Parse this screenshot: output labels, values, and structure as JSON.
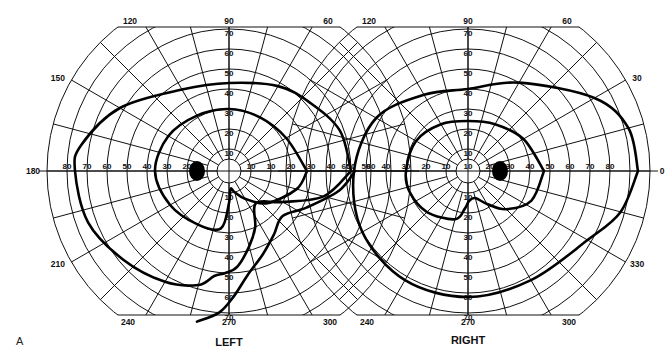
{
  "panel_label": "A",
  "chart_data": {
    "type": "polar",
    "units": "degrees of eccentricity",
    "ring_step": 10,
    "radial_range": [
      0,
      90
    ],
    "radial_tick_labels": [
      "10",
      "20",
      "30",
      "40",
      "50",
      "60",
      "70",
      "80"
    ],
    "meridian_step": 15,
    "angle_labels": [
      "0",
      "30",
      "60",
      "90",
      "120",
      "150",
      "180",
      "210",
      "240",
      "270",
      "300",
      "330"
    ],
    "charts": [
      {
        "name": "LEFT",
        "visible_angle_labels": [
          "90",
          "120",
          "60",
          "150",
          "180",
          "210",
          "240",
          "270",
          "300"
        ],
        "horizontal_tick_labels": [
          "80",
          "70",
          "60",
          "50",
          "40",
          "30",
          "20",
          "10",
          "10",
          "20",
          "30",
          "40",
          "50",
          "60"
        ],
        "vertical_tick_labels": [
          "70",
          "60",
          "50",
          "40",
          "30",
          "20",
          "10",
          "10",
          "20",
          "30",
          "40",
          "50",
          "60",
          "70"
        ],
        "blind_spot": {
          "angle": 180,
          "eccentricity": 15
        },
        "isopters": [
          {
            "name": "outer",
            "points": [
              [
                0,
                60
              ],
              [
                20,
                58
              ],
              [
                40,
                52
              ],
              [
                60,
                48
              ],
              [
                90,
                43
              ],
              [
                120,
                46
              ],
              [
                150,
                62
              ],
              [
                170,
                74
              ],
              [
                180,
                76
              ],
              [
                200,
                74
              ],
              [
                220,
                68
              ],
              [
                240,
                63
              ],
              [
                255,
                58
              ],
              [
                262,
                52
              ],
              [
                268,
                50
              ],
              [
                275,
                47
              ],
              [
                285,
                38
              ],
              [
                295,
                30
              ],
              [
                310,
                20
              ],
              [
                330,
                30
              ],
              [
                345,
                48
              ],
              [
                360,
                60
              ]
            ]
          },
          {
            "name": "inner",
            "points": [
              [
                0,
                38
              ],
              [
                30,
                32
              ],
              [
                60,
                30
              ],
              [
                90,
                30
              ],
              [
                120,
                31
              ],
              [
                150,
                34
              ],
              [
                180,
                36
              ],
              [
                210,
                33
              ],
              [
                240,
                30
              ],
              [
                262,
                28
              ],
              [
                270,
                15
              ],
              [
                275,
                8
              ],
              [
                285,
                10
              ],
              [
                300,
                15
              ],
              [
                320,
                24
              ],
              [
                345,
                34
              ],
              [
                360,
                38
              ]
            ]
          },
          {
            "name": "defect-branch",
            "points": [
              [
                258,
                76
              ],
              [
                266,
                70
              ],
              [
                272,
                62
              ],
              [
                280,
                52
              ],
              [
                292,
                44
              ],
              [
                305,
                38
              ],
              [
                320,
                34
              ],
              [
                335,
                42
              ],
              [
                350,
                55
              ],
              [
                360,
                62
              ]
            ]
          }
        ]
      },
      {
        "name": "RIGHT",
        "visible_angle_labels": [
          "90",
          "120",
          "60",
          "30",
          "0",
          "330",
          "240",
          "270",
          "300"
        ],
        "horizontal_tick_labels": [
          "60",
          "50",
          "40",
          "30",
          "20",
          "10",
          "10",
          "20",
          "30",
          "40",
          "50",
          "60",
          "70",
          "80"
        ],
        "vertical_tick_labels": [
          "70",
          "60",
          "50",
          "40",
          "30",
          "20",
          "10",
          "10",
          "20",
          "30",
          "40",
          "50",
          "60",
          "70"
        ],
        "blind_spot": {
          "angle": 0,
          "eccentricity": 15
        },
        "isopters": [
          {
            "name": "outer",
            "points": [
              [
                0,
                84
              ],
              [
                15,
                82
              ],
              [
                30,
                72
              ],
              [
                60,
                50
              ],
              [
                90,
                40
              ],
              [
                120,
                43
              ],
              [
                150,
                52
              ],
              [
                180,
                56
              ],
              [
                210,
                60
              ],
              [
                240,
                62
              ],
              [
                270,
                62
              ],
              [
                300,
                62
              ],
              [
                330,
                68
              ],
              [
                345,
                78
              ],
              [
                360,
                84
              ]
            ]
          },
          {
            "name": "inner",
            "points": [
              [
                0,
                37
              ],
              [
                30,
                31
              ],
              [
                60,
                26
              ],
              [
                90,
                24
              ],
              [
                120,
                26
              ],
              [
                150,
                29
              ],
              [
                180,
                30
              ],
              [
                200,
                30
              ],
              [
                225,
                28
              ],
              [
                255,
                24
              ],
              [
                265,
                18
              ],
              [
                272,
                14
              ],
              [
                285,
                13
              ],
              [
                300,
                18
              ],
              [
                315,
                26
              ],
              [
                335,
                34
              ],
              [
                360,
                37
              ]
            ]
          }
        ]
      }
    ]
  }
}
